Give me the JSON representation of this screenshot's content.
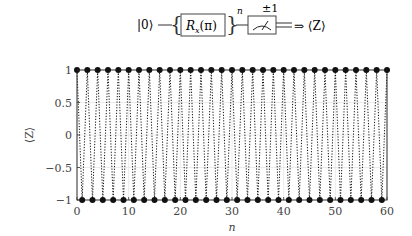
{
  "circuit": {
    "input_state": "|0⟩",
    "gate_label": "Rx(π)",
    "gate_sub": "x",
    "gate_main": "R",
    "gate_arg": "(π)",
    "repeat_exponent": "n",
    "measure_outcome": "±1",
    "output": "⇒ ⟨Z⟩"
  },
  "chart_data": {
    "type": "line",
    "title": "",
    "xlabel": "n",
    "ylabel": "⟨Z⟩",
    "xlim": [
      0,
      60
    ],
    "ylim": [
      -1,
      1
    ],
    "xticks": [
      0,
      10,
      20,
      30,
      40,
      50,
      60
    ],
    "xtick_labels": [
      "0",
      "10",
      "20",
      "30",
      "40",
      "50",
      "60"
    ],
    "yticks": [
      -1,
      -0.5,
      0,
      0.5,
      1
    ],
    "ytick_labels": [
      "−1",
      "−0.5",
      "0",
      "0.5",
      "1"
    ],
    "grid": true,
    "legend": null,
    "series": [
      {
        "name": "⟨Z⟩",
        "style": "dotted line with filled circle markers",
        "color": "#111111",
        "rule": "⟨Z⟩ = (−1)^n",
        "x": [
          0,
          1,
          2,
          3,
          4,
          5,
          6,
          7,
          8,
          9,
          10,
          11,
          12,
          13,
          14,
          15,
          16,
          17,
          18,
          19,
          20,
          21,
          22,
          23,
          24,
          25,
          26,
          27,
          28,
          29,
          30,
          31,
          32,
          33,
          34,
          35,
          36,
          37,
          38,
          39,
          40,
          41,
          42,
          43,
          44,
          45,
          46,
          47,
          48,
          49,
          50,
          51,
          52,
          53,
          54,
          55,
          56,
          57,
          58,
          59,
          60
        ],
        "values": [
          1,
          -1,
          1,
          -1,
          1,
          -1,
          1,
          -1,
          1,
          -1,
          1,
          -1,
          1,
          -1,
          1,
          -1,
          1,
          -1,
          1,
          -1,
          1,
          -1,
          1,
          -1,
          1,
          -1,
          1,
          -1,
          1,
          -1,
          1,
          -1,
          1,
          -1,
          1,
          -1,
          1,
          -1,
          1,
          -1,
          1,
          -1,
          1,
          -1,
          1,
          -1,
          1,
          -1,
          1,
          -1,
          1,
          -1,
          1,
          -1,
          1,
          -1,
          1,
          -1,
          1,
          -1,
          1
        ]
      }
    ]
  },
  "colors": {
    "ink": "#111111",
    "grid": "#dddddd",
    "axis": "#333333"
  }
}
